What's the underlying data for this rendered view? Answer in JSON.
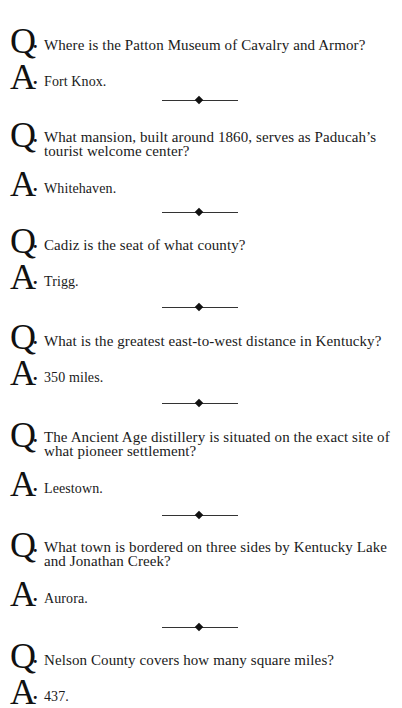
{
  "page": {
    "q_marker": "Q",
    "a_marker": "A",
    "marker_dot": ".",
    "items": [
      {
        "question": "Where is the Patton Museum of Cavalry and Armor?",
        "answer": "Fort Knox."
      },
      {
        "question_line1": "What mansion, built around 1860, serves as Paducah’s",
        "question_line2": "tourist welcome center?",
        "answer": "Whitehaven."
      },
      {
        "question": "Cadiz is the seat of what county?",
        "answer": "Trigg."
      },
      {
        "question": "What is the greatest east-to-west distance in Kentucky?",
        "answer": "350 miles."
      },
      {
        "question_line1": "The Ancient Age distillery is situated on the exact site of",
        "question_line2": "what pioneer settlement?",
        "answer": "Leestown."
      },
      {
        "question_line1": "What town is bordered on three sides by Kentucky Lake",
        "question_line2": "and Jonathan Creek?",
        "answer": "Aurora."
      },
      {
        "question": "Nelson County covers how many square miles?",
        "answer": "437."
      }
    ],
    "divider_glyph": "diamond-rule"
  }
}
